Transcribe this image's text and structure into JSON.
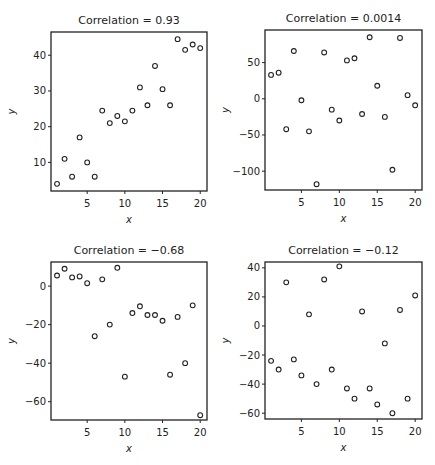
{
  "figure": {
    "background": "#ffffff",
    "ink_color": "#222222",
    "marker": "open-circle"
  },
  "chart_data": [
    {
      "type": "scatter",
      "title": "Correlation = 0.93",
      "xlabel": "x",
      "ylabel": "y",
      "xticks": [
        5,
        10,
        15,
        20
      ],
      "yticks": [
        10,
        20,
        30,
        40
      ],
      "xlim": [
        0.2,
        20.9
      ],
      "ylim": [
        2,
        46.5
      ],
      "grid": false,
      "legend": null,
      "frame": {
        "left": 51,
        "top": 32,
        "right": 207,
        "bottom": 191
      },
      "x": [
        1,
        2,
        3,
        4,
        5,
        6,
        7,
        8,
        9,
        10,
        11,
        12,
        13,
        14,
        15,
        16,
        17,
        18,
        19,
        20
      ],
      "y": [
        4,
        11,
        6,
        17,
        10,
        6,
        24.5,
        21,
        23,
        21.5,
        24.5,
        31,
        26,
        37,
        30.5,
        26,
        44.5,
        41.5,
        43,
        42
      ]
    },
    {
      "type": "scatter",
      "title": "Correlation = 0.0014",
      "xlabel": "x",
      "ylabel": "y",
      "xticks": [
        5,
        10,
        15,
        20
      ],
      "yticks": [
        -100,
        -50,
        0,
        50
      ],
      "xlim": [
        0.2,
        20.9
      ],
      "ylim": [
        -126,
        95
      ],
      "grid": false,
      "legend": null,
      "frame": {
        "left": 265,
        "top": 30,
        "right": 422,
        "bottom": 190
      },
      "x": [
        1,
        2,
        3,
        4,
        5,
        6,
        7,
        8,
        9,
        10,
        11,
        12,
        13,
        14,
        15,
        16,
        17,
        18,
        19,
        20
      ],
      "y": [
        33,
        36,
        -42,
        66,
        -2,
        -45,
        -118,
        64,
        -15,
        -30,
        53,
        56,
        -21,
        85,
        18,
        -25,
        -98,
        84,
        5,
        -9
      ]
    },
    {
      "type": "scatter",
      "title": "Correlation = −0.68",
      "xlabel": "x",
      "ylabel": "y",
      "xticks": [
        5,
        10,
        15,
        20
      ],
      "yticks": [
        -60,
        -40,
        -20,
        0
      ],
      "xlim": [
        0.2,
        20.9
      ],
      "ylim": [
        -69.5,
        12.5
      ],
      "grid": false,
      "legend": null,
      "frame": {
        "left": 51,
        "top": 262,
        "right": 207,
        "bottom": 420
      },
      "x": [
        1,
        2,
        3,
        4,
        5,
        6,
        7,
        8,
        9,
        10,
        11,
        12,
        13,
        14,
        15,
        16,
        17,
        18,
        19,
        20
      ],
      "y": [
        5.5,
        9,
        4.5,
        5,
        1.5,
        -26,
        3.5,
        -20,
        9.5,
        -47,
        -14,
        -10.5,
        -15,
        -15,
        -18,
        -46,
        -16,
        -40,
        -10,
        -67
      ]
    },
    {
      "type": "scatter",
      "title": "Correlation = −0.12",
      "xlabel": "x",
      "ylabel": "y",
      "xticks": [
        5,
        10,
        15,
        20
      ],
      "yticks": [
        -60,
        -40,
        -20,
        0,
        20,
        40
      ],
      "xlim": [
        0.2,
        20.9
      ],
      "ylim": [
        -64,
        44
      ],
      "grid": false,
      "legend": null,
      "frame": {
        "left": 265,
        "top": 262,
        "right": 422,
        "bottom": 419
      },
      "x": [
        1,
        2,
        3,
        4,
        5,
        6,
        7,
        8,
        9,
        10,
        11,
        12,
        13,
        14,
        15,
        16,
        17,
        18,
        19,
        20
      ],
      "y": [
        -24,
        -30,
        30,
        -23,
        -34,
        8,
        -40,
        32,
        -30,
        41,
        -43,
        -50,
        10,
        -43,
        -54,
        -12,
        -60,
        11,
        -50,
        21
      ]
    }
  ]
}
